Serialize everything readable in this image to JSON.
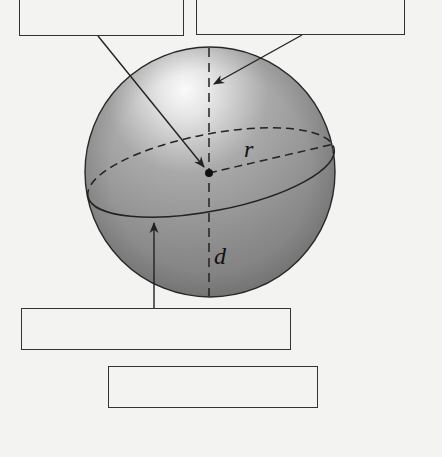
{
  "diagram": {
    "labels": {
      "radius": "r",
      "diameter": "d"
    },
    "label_boxes": [
      {
        "id": "box-top-left",
        "text": "",
        "points_to": "center"
      },
      {
        "id": "box-top-right",
        "text": "",
        "points_to": "diameter-axis"
      },
      {
        "id": "box-bottom-left",
        "text": "",
        "points_to": "great-circle"
      },
      {
        "id": "box-bottom-center",
        "text": "",
        "points_to": ""
      }
    ]
  },
  "colors": {
    "background": "#f3f3f1",
    "sphere_dark": "#7d7d7d",
    "sphere_light": "#f2f2f2",
    "stroke": "#222222"
  }
}
